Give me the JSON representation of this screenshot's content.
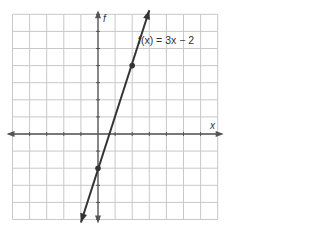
{
  "chart_data": {
    "type": "line",
    "title": "",
    "function_label": "f(x) = 3x − 2",
    "xlabel": "x",
    "ylabel": "f",
    "xlim": [
      -5,
      7
    ],
    "ylim": [
      -5,
      7
    ],
    "grid": true,
    "slope": 3,
    "intercept": -2,
    "points": [
      {
        "x": 0,
        "y": -2
      },
      {
        "x": 2,
        "y": 4
      }
    ],
    "line_extent": {
      "x_start": -1,
      "x_end": 3
    }
  },
  "colors": {
    "grid": "#c8c8c8",
    "axis": "#555555",
    "line": "#333333"
  }
}
